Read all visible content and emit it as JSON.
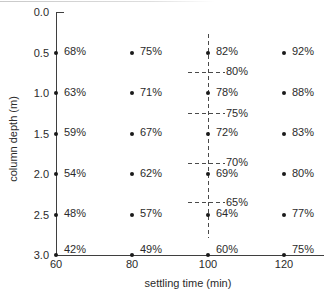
{
  "figure": {
    "background": "#ffffff",
    "text_color": "#2b2b2b",
    "axis_color": "#3f3f3f",
    "dot_color": "#1a1a1a"
  },
  "chart_data": {
    "type": "scatter",
    "title": "",
    "xlabel": "settling time (min)",
    "ylabel": "column depth (m)",
    "x_ticks": [
      "60",
      "80",
      "100",
      "120"
    ],
    "x_tick_values": [
      60,
      80,
      100,
      120
    ],
    "y_ticks": [
      "0.0",
      "0.5",
      "1.0",
      "1.5",
      "2.0",
      "2.5",
      "3.0"
    ],
    "y_tick_values": [
      0,
      0.5,
      1,
      1.5,
      2,
      2.5,
      3
    ],
    "xlim": [
      60,
      130
    ],
    "ylim": [
      0,
      3
    ],
    "grid": false,
    "legend": null,
    "y_axis_inverted": true,
    "point_label_format": "{pct}%",
    "series": [
      {
        "settling_time_min": 60,
        "points": [
          {
            "depth_m": 0.5,
            "pct": 68
          },
          {
            "depth_m": 1.0,
            "pct": 63
          },
          {
            "depth_m": 1.5,
            "pct": 59
          },
          {
            "depth_m": 2.0,
            "pct": 54
          },
          {
            "depth_m": 2.5,
            "pct": 48
          },
          {
            "depth_m": 3.0,
            "pct": 42
          }
        ]
      },
      {
        "settling_time_min": 80,
        "points": [
          {
            "depth_m": 0.5,
            "pct": 75
          },
          {
            "depth_m": 1.0,
            "pct": 71
          },
          {
            "depth_m": 1.5,
            "pct": 67
          },
          {
            "depth_m": 2.0,
            "pct": 62
          },
          {
            "depth_m": 2.5,
            "pct": 57
          },
          {
            "depth_m": 3.0,
            "pct": 49
          }
        ]
      },
      {
        "settling_time_min": 100,
        "points": [
          {
            "depth_m": 0.5,
            "pct": 82
          },
          {
            "depth_m": 1.0,
            "pct": 78
          },
          {
            "depth_m": 1.5,
            "pct": 72
          },
          {
            "depth_m": 2.0,
            "pct": 69
          },
          {
            "depth_m": 2.5,
            "pct": 64
          },
          {
            "depth_m": 3.0,
            "pct": 60
          }
        ]
      },
      {
        "settling_time_min": 120,
        "points": [
          {
            "depth_m": 0.5,
            "pct": 92
          },
          {
            "depth_m": 1.0,
            "pct": 88
          },
          {
            "depth_m": 1.5,
            "pct": 83
          },
          {
            "depth_m": 2.0,
            "pct": 80
          },
          {
            "depth_m": 2.5,
            "pct": 77
          },
          {
            "depth_m": 3.0,
            "pct": 75
          }
        ]
      }
    ],
    "dashed_guide": {
      "at_time_min": 100,
      "from_depth_m": 0.27,
      "to_depth_m": 2.79,
      "iso_labels": [
        {
          "pct": 80,
          "depth_m": 0.74
        },
        {
          "pct": 75,
          "depth_m": 1.25
        },
        {
          "pct": 70,
          "depth_m": 1.86
        },
        {
          "pct": 65,
          "depth_m": 2.35
        }
      ]
    }
  }
}
